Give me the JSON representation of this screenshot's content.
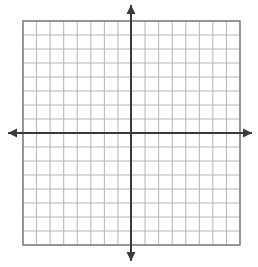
{
  "canvas": {
    "width": 258,
    "height": 267,
    "background_color": "#ffffff"
  },
  "chart_data": {
    "type": "grid",
    "title": "",
    "subtitle": "",
    "xlabel": "",
    "ylabel": "",
    "grid": {
      "visible": true,
      "columns": 16,
      "rows": 16,
      "columns_left_of_y_axis": 8,
      "columns_right_of_y_axis": 8,
      "rows_above_x_axis": 8,
      "rows_below_x_axis": 8,
      "cell_width_px": 13.5625,
      "cell_height_px": 14.0,
      "line_color": "#b4b4b4",
      "line_width_px": 1,
      "border_color": "#7a7a7a",
      "border_width_px": 1.4,
      "left_px": 23,
      "top_px": 21,
      "right_px": 240,
      "bottom_px": 245
    },
    "axes": {
      "color": "#3a3a3a",
      "line_width_px": 2,
      "origin_x_px": 131,
      "origin_y_px": 133,
      "xlim": [
        -8,
        8
      ],
      "ylim": [
        -8,
        8
      ],
      "x_tick_labels": [],
      "y_tick_labels": [],
      "origin_label": "",
      "arrowheads": [
        "left",
        "right",
        "up",
        "down"
      ],
      "arrow_half_width_px": 4.5,
      "arrow_length_px": 9,
      "x_axis_left_tip_px": 8,
      "x_axis_right_tip_px": 252,
      "y_axis_top_tip_px": 5,
      "y_axis_bottom_tip_px": 261
    },
    "series": [],
    "values": [],
    "categories": [],
    "legend": {
      "visible": false,
      "position": "none",
      "entries": []
    },
    "annotations": []
  },
  "accessibility": {
    "graph_label": "Empty coordinate plane graph paper"
  }
}
